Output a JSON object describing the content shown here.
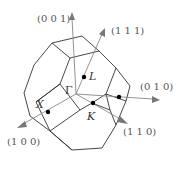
{
  "diagram": {
    "title": "",
    "type": "Brillouin zone (FCC, truncated octahedron)",
    "axes": [
      {
        "id": "001",
        "label": "(0 0 1)"
      },
      {
        "id": "111",
        "label": "(1 1 1)"
      },
      {
        "id": "010",
        "label": "(0 1 0)"
      },
      {
        "id": "110",
        "label": "(1 1 0)"
      },
      {
        "id": "100",
        "label": "(1 0 0)"
      }
    ],
    "points": [
      {
        "id": "gamma",
        "label": "Γ"
      },
      {
        "id": "L",
        "label": "L"
      },
      {
        "id": "X",
        "label": "X"
      },
      {
        "id": "K",
        "label": "K"
      }
    ],
    "colors": {
      "edge": "#333333",
      "axis": "#888888",
      "label": "#555555",
      "point": "#000000"
    }
  }
}
